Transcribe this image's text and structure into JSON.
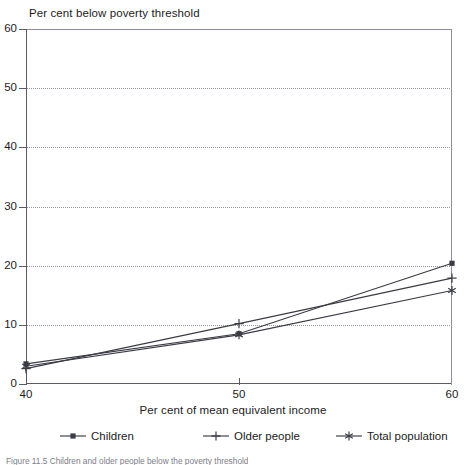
{
  "chart_data": {
    "type": "line",
    "title": "",
    "ylabel": "Per cent below poverty threshold",
    "xlabel": "Per cent of mean equivalent income",
    "x": [
      40,
      50,
      60
    ],
    "xlim": [
      40,
      60
    ],
    "ylim": [
      0,
      60
    ],
    "xticks": [
      "40",
      "50",
      "60"
    ],
    "yticks": [
      "0",
      "10",
      "20",
      "30",
      "40",
      "50",
      "60"
    ],
    "grid": "horizontal-dotted",
    "legend_position": "bottom",
    "series": [
      {
        "name": "Children",
        "marker": "square",
        "values": [
          3.4,
          8.5,
          20.4
        ]
      },
      {
        "name": "Older people",
        "marker": "plus",
        "values": [
          2.6,
          10.2,
          17.9
        ]
      },
      {
        "name": "Total population",
        "marker": "asterisk",
        "values": [
          3.0,
          8.3,
          15.8
        ]
      }
    ]
  },
  "axes": {
    "y_title": "Per cent below poverty threshold",
    "x_title": "Per cent of mean equivalent income",
    "y_ticks": [
      {
        "label": "60",
        "value": 60
      },
      {
        "label": "50",
        "value": 50
      },
      {
        "label": "40",
        "value": 40
      },
      {
        "label": "30",
        "value": 30
      },
      {
        "label": "20",
        "value": 20
      },
      {
        "label": "10",
        "value": 10
      },
      {
        "label": "0",
        "value": 0
      }
    ],
    "x_ticks": [
      {
        "label": "40",
        "value": 40
      },
      {
        "label": "50",
        "value": 50
      },
      {
        "label": "60",
        "value": 60
      }
    ]
  },
  "legend": {
    "items": [
      {
        "label": "Children",
        "marker": "square-marker-icon"
      },
      {
        "label": "Older people",
        "marker": "plus-marker-icon"
      },
      {
        "label": "Total population",
        "marker": "asterisk-marker-icon"
      }
    ]
  },
  "caption": {
    "text": "Figure 11.5   Children and older people below the poverty threshold"
  },
  "colors": {
    "line": "#3b3b46",
    "axis": "#5a5a68",
    "grid": "#9a9aa6",
    "text": "#1c1c1c",
    "background": "#ffffff"
  }
}
